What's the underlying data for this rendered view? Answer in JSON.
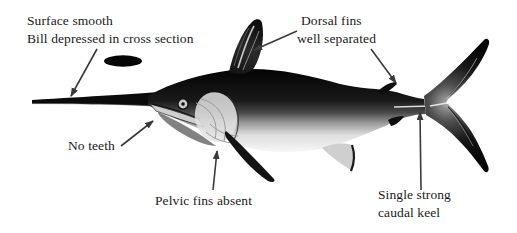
{
  "figure": {
    "background_color": "#ffffff",
    "text_color": "#1a1a1a",
    "arrow_color": "#3a3a3a",
    "illustration": "swordfish-side-view",
    "cross_section_icon": "bill-cross-section-ellipse",
    "labels": {
      "surface": {
        "line1": "Surface smooth",
        "line2": "Bill depressed in cross section"
      },
      "dorsal": {
        "line1": "Dorsal fins",
        "line2": "well separated"
      },
      "teeth": {
        "text": "No teeth"
      },
      "pelvic": {
        "text": "Pelvic fins absent"
      },
      "keel": {
        "line1": "Single strong",
        "line2": "caudal keel"
      }
    }
  }
}
